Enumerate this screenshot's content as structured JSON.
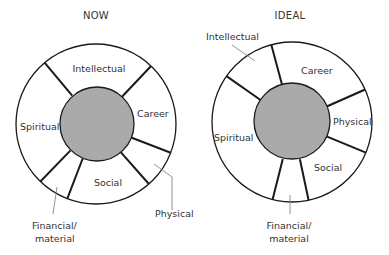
{
  "diagrams": [
    {
      "title": "NOW",
      "center": [
        96,
        124
      ],
      "outer_radius": 80,
      "inner_radius": 37,
      "divider_angles_deg": [
        -130,
        -46.5,
        21,
        48.6,
        111,
        134
      ],
      "segments": [
        {
          "label": "Intellectual"
        },
        {
          "label": "Career"
        },
        {
          "label": "Physical"
        },
        {
          "label": "Social"
        },
        {
          "label": "Financial/"
        },
        {
          "label": "Spiritual"
        }
      ],
      "financial_line2": "material"
    },
    {
      "title": "IDEAL",
      "center": [
        292,
        122
      ],
      "outer_radius": 80,
      "inner_radius": 38,
      "divider_angles_deg": [
        -145,
        -105,
        -24,
        22.6,
        78,
        104
      ],
      "segments": [
        {
          "label": "Intellectual"
        },
        {
          "label": "Career"
        },
        {
          "label": "Physical"
        },
        {
          "label": "Social"
        },
        {
          "label": "Financial/"
        },
        {
          "label": "Spiritual"
        }
      ],
      "financial_line2": "material"
    }
  ],
  "colors": {
    "hub_fill": "#aaaaaa",
    "stroke": "#1a1a1a",
    "leader": "#777777",
    "text": "#333333"
  }
}
